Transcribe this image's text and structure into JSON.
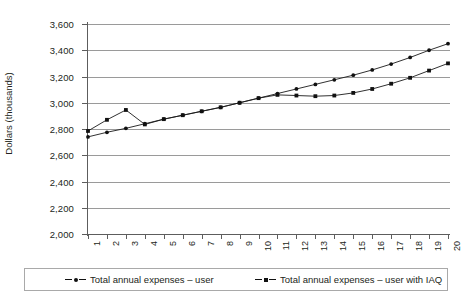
{
  "chart_data": {
    "type": "line",
    "title": "",
    "xlabel": "",
    "ylabel": "Dollars (thousands)",
    "ylim": [
      2000,
      3600
    ],
    "ytick_step": 200,
    "yticks": [
      "2,000",
      "2,200",
      "2,400",
      "2,600",
      "2,800",
      "3,000",
      "3,200",
      "3,400",
      "3,600"
    ],
    "x": [
      1,
      2,
      3,
      4,
      5,
      6,
      7,
      8,
      9,
      10,
      11,
      12,
      13,
      14,
      15,
      16,
      17,
      18,
      19,
      20
    ],
    "xticklabels": [
      "1",
      "2",
      "3",
      "4",
      "5",
      "6",
      "7",
      "8",
      "9",
      "10",
      "11",
      "12",
      "13",
      "14",
      "15",
      "16",
      "17",
      "18",
      "19",
      "20"
    ],
    "grid": true,
    "legend_position": "bottom",
    "series": [
      {
        "name": "Total annual expenses – user",
        "marker": "circle",
        "values": [
          2740,
          2775,
          2805,
          2840,
          2875,
          2905,
          2935,
          2965,
          3000,
          3035,
          3070,
          3105,
          3140,
          3175,
          3210,
          3250,
          3295,
          3345,
          3400,
          3450
        ]
      },
      {
        "name": "Total annual expenses – user with IAQ",
        "marker": "square",
        "values": [
          2785,
          2870,
          2945,
          2835,
          2875,
          2905,
          2935,
          2965,
          3000,
          3035,
          3060,
          3055,
          3050,
          3055,
          3075,
          3105,
          3145,
          3190,
          3245,
          3300
        ]
      }
    ]
  },
  "legend": {
    "items": [
      {
        "label": "Total annual expenses – user",
        "marker": "circle-marker-icon"
      },
      {
        "label": "Total annual expenses – user with IAQ",
        "marker": "square-marker-icon"
      }
    ]
  }
}
